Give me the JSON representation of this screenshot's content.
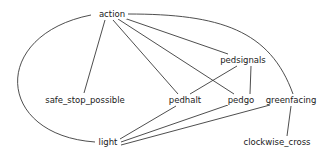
{
  "diagram": {
    "type": "undirected-graph",
    "nodes": [
      {
        "id": "action",
        "label": "action",
        "x": 112,
        "y": 14
      },
      {
        "id": "pedsignals",
        "label": "pedsignals",
        "x": 243,
        "y": 60
      },
      {
        "id": "safe_stop_possible",
        "label": "safe_stop_possible",
        "x": 85,
        "y": 100
      },
      {
        "id": "pedhalt",
        "label": "pedhalt",
        "x": 185,
        "y": 100
      },
      {
        "id": "pedgo",
        "label": "pedgo",
        "x": 241,
        "y": 100
      },
      {
        "id": "greenfacing",
        "label": "greenfacing",
        "x": 291,
        "y": 100
      },
      {
        "id": "clockwise_cross",
        "label": "clockwise_cross",
        "x": 277,
        "y": 142
      },
      {
        "id": "light",
        "label": "light",
        "x": 108,
        "y": 142
      }
    ],
    "edges": [
      {
        "from": "action",
        "to": "light",
        "path": "M 91 15 C -10 35, -5 135, 95 142"
      },
      {
        "from": "action",
        "to": "safe_stop_possible",
        "path": "M 105 20 L 84 93"
      },
      {
        "from": "action",
        "to": "pedhalt",
        "path": "M 113 20 L 178 94"
      },
      {
        "from": "action",
        "to": "pedgo",
        "path": "M 118 19 L 234 94"
      },
      {
        "from": "action",
        "to": "pedsignals",
        "path": "M 121 17 L 228 54"
      },
      {
        "from": "action",
        "to": "greenfacing",
        "path": "M 128 14 C 220 14, 270 30, 293 94"
      },
      {
        "from": "pedsignals",
        "to": "pedhalt",
        "path": "M 237 66 L 190 94"
      },
      {
        "from": "pedsignals",
        "to": "pedgo",
        "path": "M 251 66 L 250 94"
      },
      {
        "from": "pedhalt",
        "to": "light",
        "path": "M 176 106 L 120 139"
      },
      {
        "from": "pedgo",
        "to": "light",
        "path": "M 228 105 L 121 142"
      },
      {
        "from": "greenfacing",
        "to": "light",
        "path": "M 270 105 L 121 145"
      },
      {
        "from": "greenfacing",
        "to": "clockwise_cross",
        "path": "M 291 106 L 287 136"
      }
    ]
  }
}
